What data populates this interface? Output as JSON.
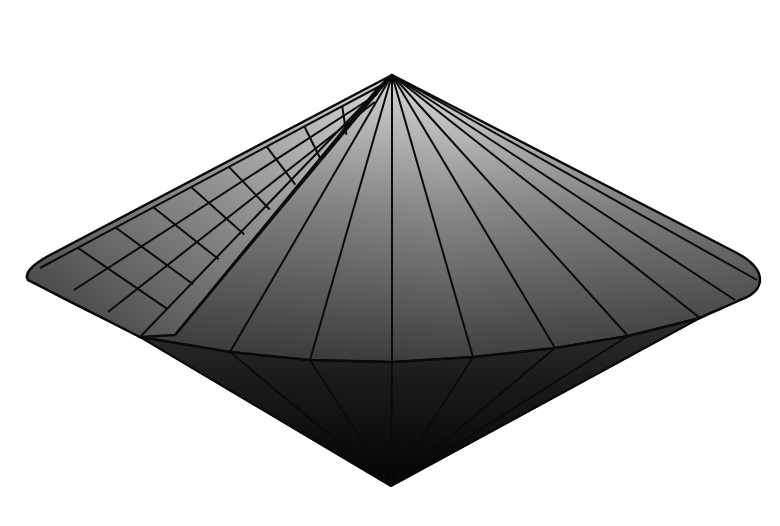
{
  "figure": {
    "background": "#ffffff",
    "stroke": "#0a0a0a",
    "apex": [
      392,
      75
    ],
    "bottom_tip": [
      391,
      486
    ],
    "left_tip": [
      28,
      278
    ],
    "right_tip": [
      758,
      277
    ],
    "colors": {
      "upper_light": "#d6d6d6",
      "upper_dark": "#4a4a4a",
      "lower_top": "#3c3c3c",
      "lower_bottom": "#050505",
      "flap_light": "#cfcfcf",
      "flap_dark": "#2e2e2e"
    },
    "belt": [
      [
        140,
        337
      ],
      [
        230,
        352
      ],
      [
        310,
        360
      ],
      [
        392,
        362
      ],
      [
        473,
        357
      ],
      [
        555,
        348
      ],
      [
        628,
        336
      ],
      [
        700,
        318
      ]
    ],
    "upper_fan_ends": [
      [
        140,
        337
      ],
      [
        175,
        335
      ],
      [
        230,
        352
      ],
      [
        310,
        360
      ],
      [
        392,
        362
      ],
      [
        473,
        357
      ],
      [
        555,
        348
      ],
      [
        628,
        336
      ],
      [
        700,
        318
      ],
      [
        735,
        300
      ],
      [
        757,
        280
      ]
    ],
    "lower_fan_from": [
      [
        140,
        337
      ],
      [
        230,
        352
      ],
      [
        310,
        360
      ],
      [
        392,
        362
      ],
      [
        473,
        357
      ],
      [
        555,
        348
      ],
      [
        628,
        336
      ],
      [
        700,
        318
      ]
    ],
    "flap_grid": {
      "outer_edge": [
        [
          392,
          75
        ],
        [
          28,
          278
        ]
      ],
      "rows": 3,
      "cols": 9
    }
  }
}
